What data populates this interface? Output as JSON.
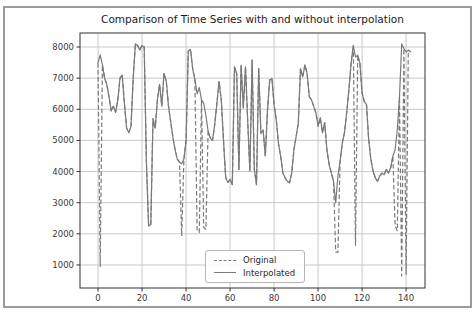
{
  "title": "Comparison of Time Series with and without interpolation",
  "legend": {
    "items": [
      {
        "label": "Original",
        "style": "dashed"
      },
      {
        "label": "Interpolated",
        "style": "solid"
      }
    ]
  },
  "colors": {
    "series": "#7a7a7a",
    "grid": "#c9c9c9",
    "spine": "#333333",
    "tick_text": "#3a3a3a",
    "figure_border": "#9a9a9a",
    "background": "#ffffff"
  },
  "chart_data": {
    "type": "line",
    "title": "Comparison of Time Series with and without interpolation",
    "xlabel": "",
    "ylabel": "",
    "x_start": 0,
    "x_step": 1,
    "xlim": [
      -8.2,
      148.6
    ],
    "ylim": [
      260,
      8450
    ],
    "x_ticks": [
      0,
      20,
      40,
      60,
      80,
      100,
      120,
      140
    ],
    "y_ticks": [
      1000,
      2000,
      3000,
      4000,
      5000,
      6000,
      7000,
      8000
    ],
    "grid": true,
    "legend_position": "lower center",
    "series": [
      {
        "name": "Original",
        "style": "dashed",
        "values": [
          7490,
          950,
          7430,
          7000,
          6800,
          6400,
          5950,
          6100,
          5900,
          6300,
          7000,
          7100,
          6200,
          5400,
          5250,
          5450,
          7000,
          8100,
          8050,
          7900,
          8050,
          8000,
          4330,
          2250,
          2300,
          5700,
          5400,
          6300,
          6800,
          6100,
          7150,
          6900,
          6100,
          5600,
          5100,
          4700,
          4400,
          4300,
          1950,
          4400,
          5000,
          7870,
          7920,
          7300,
          6950,
          2100,
          2050,
          6300,
          2200,
          2150,
          5300,
          5070,
          5000,
          5500,
          6200,
          6890,
          6300,
          5000,
          3800,
          3650,
          3750,
          3580,
          7360,
          7150,
          4070,
          7420,
          6050,
          7360,
          5620,
          4010,
          7580,
          4070,
          3580,
          7310,
          5230,
          5340,
          4500,
          5980,
          6940,
          6990,
          6140,
          5660,
          4900,
          4480,
          3950,
          3800,
          3690,
          3640,
          3950,
          4700,
          5120,
          5550,
          7310,
          7040,
          7420,
          7150,
          6400,
          6300,
          6100,
          5890,
          5460,
          5730,
          5250,
          5570,
          4700,
          4230,
          3960,
          3690,
          1420,
          1400,
          4330,
          4920,
          5250,
          5890,
          6630,
          7480,
          8050,
          1630,
          7740,
          7480,
          6520,
          6250,
          6150,
          5020,
          4380,
          4010,
          3800,
          3690,
          3850,
          3950,
          3900,
          4070,
          3950,
          4120,
          4500,
          2250,
          2100,
          6400,
          650,
          7950,
          700,
          7900,
          7840
        ]
      },
      {
        "name": "Interpolated",
        "style": "solid",
        "values": [
          7490,
          7750,
          7430,
          7000,
          6800,
          6400,
          5950,
          6100,
          5900,
          6300,
          7000,
          7100,
          6200,
          5400,
          5250,
          5450,
          7000,
          8100,
          8050,
          7900,
          8050,
          8000,
          4330,
          2250,
          2300,
          5700,
          5400,
          6300,
          6800,
          6100,
          7150,
          6900,
          6100,
          5600,
          5100,
          4700,
          4400,
          4300,
          4250,
          4400,
          5000,
          7870,
          7920,
          7300,
          6950,
          6500,
          6700,
          6300,
          6200,
          5800,
          5300,
          5070,
          5000,
          5500,
          6200,
          6890,
          6300,
          5000,
          3800,
          3650,
          3750,
          3580,
          7360,
          7150,
          4070,
          7420,
          6050,
          7360,
          5620,
          4010,
          7580,
          4070,
          3580,
          7310,
          5230,
          5340,
          4500,
          5980,
          6940,
          6990,
          6140,
          5660,
          4900,
          4480,
          3950,
          3800,
          3690,
          3640,
          3950,
          4700,
          5120,
          5550,
          7310,
          7040,
          7420,
          7150,
          6400,
          6300,
          6100,
          5890,
          5460,
          5730,
          5250,
          5570,
          4700,
          4230,
          3960,
          3690,
          3000,
          3850,
          4330,
          4920,
          5250,
          5890,
          6630,
          7480,
          8050,
          7680,
          7740,
          7480,
          6520,
          6250,
          6150,
          5020,
          4380,
          4010,
          3800,
          3690,
          3850,
          3950,
          3900,
          4070,
          3950,
          4120,
          4500,
          4700,
          5340,
          6400,
          8100,
          7950,
          7840,
          7900,
          7840
        ]
      }
    ]
  }
}
